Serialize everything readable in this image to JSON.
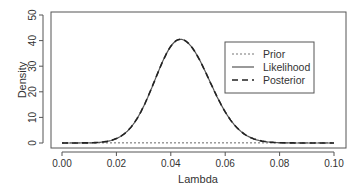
{
  "chart_data": {
    "type": "line",
    "title": "",
    "xlabel": "Lambda",
    "ylabel": "Density",
    "xlim": [
      0.0,
      0.1
    ],
    "ylim": [
      0,
      50
    ],
    "x_ticks": [
      "0.00",
      "0.02",
      "0.04",
      "0.06",
      "0.08",
      "0.10"
    ],
    "y_ticks": [
      "0",
      "10",
      "20",
      "30",
      "40",
      "50"
    ],
    "grid": false,
    "legend": {
      "position": "upper right",
      "entries": [
        {
          "label": "Prior",
          "style": "dotted"
        },
        {
          "label": "Likelihood",
          "style": "solid"
        },
        {
          "label": "Posterior",
          "style": "dashed"
        }
      ]
    },
    "series": [
      {
        "name": "Prior",
        "style": "dotted",
        "description": "flat near 0 across range",
        "x": [
          0.0,
          0.1
        ],
        "y": [
          0.05,
          0.05
        ]
      },
      {
        "name": "Likelihood",
        "style": "solid",
        "peak_x": 0.0435,
        "peak_y": 40.5,
        "x": [
          0.0,
          0.01,
          0.02,
          0.025,
          0.03,
          0.035,
          0.04,
          0.0435,
          0.05,
          0.055,
          0.06,
          0.065,
          0.07,
          0.08,
          0.09,
          0.1
        ],
        "y": [
          0.0,
          0.0,
          2.3,
          6.7,
          15.0,
          27.4,
          38.3,
          40.5,
          32.7,
          20.4,
          10.2,
          4.1,
          1.3,
          0.1,
          0.0,
          0.0
        ]
      },
      {
        "name": "Posterior",
        "style": "dashed",
        "peak_x": 0.0435,
        "peak_y": 40.5,
        "x": [
          0.0,
          0.01,
          0.02,
          0.025,
          0.03,
          0.035,
          0.04,
          0.0435,
          0.05,
          0.055,
          0.06,
          0.065,
          0.07,
          0.08,
          0.09,
          0.1
        ],
        "y": [
          0.0,
          0.0,
          2.3,
          6.7,
          15.0,
          27.4,
          38.3,
          40.5,
          32.7,
          20.4,
          10.2,
          4.1,
          1.3,
          0.1,
          0.0,
          0.0
        ]
      }
    ]
  }
}
